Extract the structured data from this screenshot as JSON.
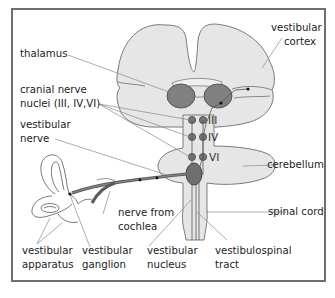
{
  "diagram": {
    "colors": {
      "frame": "#6e6e6e",
      "brain_fill": "#e6e6e6",
      "outline": "#7a7a7a",
      "nucleus_fill": "#808080",
      "nerve": "#5a5a5a",
      "leader": "#8a8a8a",
      "text": "#222222"
    },
    "labels": {
      "thalamus": "thalamus",
      "cranial_nerve_nuclei_1": "cranial nerve",
      "cranial_nerve_nuclei_2": "nuclei (III, IV,VI)",
      "vestibular_nerve_1": "vestibular",
      "vestibular_nerve_2": "nerve",
      "vestibular_cortex_1": "vestibular",
      "vestibular_cortex_2": "cortex",
      "cerebellum": "cerebellum",
      "spinal_cord": "spinal cord",
      "nerve_from_cochlea_1": "nerve from",
      "nerve_from_cochlea_2": "cochlea",
      "vestibular_apparatus_1": "vestibular",
      "vestibular_apparatus_2": "apparatus",
      "vestibular_ganglion_1": "vestibular",
      "vestibular_ganglion_2": "ganglion",
      "vestibular_nucleus_1": "vestibular",
      "vestibular_nucleus_2": "nucleus",
      "vestibulospinal_tract_1": "vestibulospinal",
      "vestibulospinal_tract_2": "tract"
    },
    "cranial_nerve_numerals": [
      "III",
      "IV",
      "VI"
    ]
  }
}
